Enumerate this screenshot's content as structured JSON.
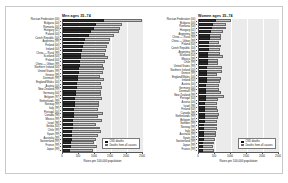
{
  "figure": {
    "background": "#ffffff",
    "plot_background": "#ebebeb",
    "colors": {
      "cvd_deaths": "#303030",
      "all_causes": "#c4c4c4",
      "axis": "#555555",
      "gridline": "#ffffff"
    }
  },
  "legend": {
    "cvd_label": "CVD deaths",
    "total_label": "Deaths from all causes"
  },
  "axis": {
    "xlabel": "Rates per 100,000 population",
    "ticks": [
      "0",
      "500",
      "1000",
      "1500",
      "2000",
      "2500"
    ],
    "tick_values": [
      0,
      500,
      1000,
      1500,
      2000,
      2500
    ],
    "xlim": [
      0,
      2500
    ]
  },
  "chart_data": [
    {
      "type": "bar",
      "orientation": "horizontal",
      "title": "Men ages 35–74",
      "xlabel": "Rates per 100,000 population",
      "ylabel": "",
      "xlim": [
        0,
        2500
      ],
      "grid": true,
      "legend_position": "lower-right",
      "categories": [
        "Russian Federation (00)",
        "Bulgaria (00)",
        "Romania (00)",
        "Hungary (01)",
        "Poland (00)",
        "Czech Republic (00)",
        "Argentina (99)",
        "Finland (00)",
        "Ireland (00)",
        "China — Rural (99)",
        "Scotland (00)",
        "Poland (00)",
        "China — Urban (99)",
        "Northern Ireland (00)",
        "United States (99)",
        "Greece (99)",
        "Denmark (99)",
        "England/Wales (00)",
        "Austria (00)",
        "New Zealand (99)",
        "Germany (00)",
        "Belgium (97)",
        "Netherlands (99)",
        "Norway (99)",
        "Italy (99)",
        "Portugal (00)",
        "Canada (98)",
        "Mexico (99)",
        "Israel (98)",
        "Serbia (00)",
        "Chile (99)",
        "Spain (99)",
        "Australia (99)",
        "Switzerland (99)",
        "France (99)",
        "Japan (99)"
      ],
      "series": [
        {
          "name": "CVD deaths",
          "values": [
            1290,
            1020,
            960,
            870,
            800,
            700,
            660,
            620,
            600,
            570,
            555,
            540,
            520,
            505,
            490,
            470,
            455,
            445,
            430,
            415,
            400,
            390,
            380,
            365,
            350,
            340,
            330,
            320,
            310,
            300,
            290,
            280,
            270,
            255,
            245,
            230
          ]
        },
        {
          "name": "Deaths from all causes",
          "values": [
            2460,
            1850,
            1780,
            1760,
            1580,
            1470,
            1440,
            1360,
            1330,
            1310,
            1420,
            1300,
            1240,
            1290,
            1260,
            1150,
            1280,
            1200,
            1230,
            1190,
            1180,
            1220,
            1130,
            1120,
            1100,
            1240,
            1090,
            1210,
            1040,
            1170,
            1180,
            1080,
            1020,
            980,
            1070,
            940
          ]
        }
      ]
    },
    {
      "type": "bar",
      "orientation": "horizontal",
      "title": "Women ages 35–74",
      "xlabel": "Rates per 100,000 population",
      "ylabel": "",
      "xlim": [
        0,
        2500
      ],
      "grid": true,
      "legend_position": "lower-right",
      "categories": [
        "Russian Federation (00)",
        "Bulgaria (00)",
        "Romania (00)",
        "Hungary (01)",
        "Argentina (99)",
        "China — Rural (99)",
        "China — Urban (99)",
        "Poland (00)",
        "Czech Republic (00)",
        "Argentina (99)",
        "Scotland (00)",
        "Mexico (99)",
        "Chile (99)",
        "United States (99)",
        "Northern Ireland (00)",
        "Greece (99)",
        "England/Wales (00)",
        "Ireland (00)",
        "Austria (00)",
        "Germany (00)",
        "Denmark (99)",
        "New Zealand (99)",
        "Portugal (00)",
        "Austria (00)",
        "Israel (98)",
        "Finland (00)",
        "Canada (98)",
        "Netherlands (99)",
        "Belgium (97)",
        "Sweden (99)",
        "Norway (99)",
        "Italy (99)",
        "Australia (99)",
        "Spain (99)",
        "Switzerland (99)",
        "Japan (99)",
        "France (99)"
      ],
      "series": [
        {
          "name": "CVD deaths",
          "values": [
            520,
            430,
            420,
            360,
            340,
            330,
            320,
            310,
            300,
            290,
            280,
            275,
            268,
            260,
            255,
            248,
            240,
            235,
            228,
            222,
            215,
            210,
            205,
            200,
            195,
            190,
            185,
            180,
            175,
            170,
            165,
            158,
            152,
            146,
            140,
            132,
            120
          ]
        },
        {
          "name": "Deaths from all causes",
          "values": [
            1000,
            840,
            830,
            760,
            700,
            690,
            640,
            680,
            660,
            650,
            740,
            600,
            590,
            720,
            710,
            560,
            690,
            670,
            620,
            610,
            700,
            780,
            580,
            570,
            560,
            600,
            620,
            590,
            570,
            560,
            550,
            530,
            540,
            500,
            480,
            440,
            460
          ]
        }
      ]
    }
  ]
}
